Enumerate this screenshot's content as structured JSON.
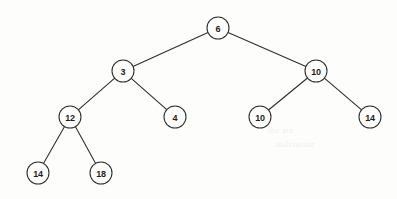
{
  "figure": {
    "width": 397,
    "height": 199,
    "background_color": "#fdfdfb",
    "stroke_color": "#2b2b2b",
    "label_color": "#1d1d1d",
    "node_radius": 11
  },
  "tree": {
    "nodes": [
      {
        "id": "n0",
        "label": "6",
        "x": 218,
        "y": 28,
        "level": 0
      },
      {
        "id": "n1",
        "label": "3",
        "x": 123,
        "y": 71,
        "level": 1
      },
      {
        "id": "n2",
        "label": "10",
        "x": 316,
        "y": 71,
        "level": 1
      },
      {
        "id": "n3",
        "label": "12",
        "x": 70,
        "y": 117,
        "level": 2
      },
      {
        "id": "n4",
        "label": "4",
        "x": 175,
        "y": 117,
        "level": 2
      },
      {
        "id": "n5",
        "label": "10",
        "x": 260,
        "y": 117,
        "level": 2
      },
      {
        "id": "n6",
        "label": "14",
        "x": 370,
        "y": 117,
        "level": 2
      },
      {
        "id": "n7",
        "label": "14",
        "x": 38,
        "y": 173,
        "level": 3
      },
      {
        "id": "n8",
        "label": "18",
        "x": 101,
        "y": 173,
        "level": 3
      }
    ],
    "edges": [
      {
        "from": "n0",
        "to": "n1"
      },
      {
        "from": "n0",
        "to": "n2"
      },
      {
        "from": "n1",
        "to": "n3"
      },
      {
        "from": "n1",
        "to": "n4"
      },
      {
        "from": "n2",
        "to": "n5"
      },
      {
        "from": "n2",
        "to": "n6"
      },
      {
        "from": "n3",
        "to": "n7"
      },
      {
        "from": "n3",
        "to": "n8"
      }
    ]
  },
  "artifacts": [
    {
      "text": "the are",
      "x": 268,
      "y": 126
    },
    {
      "text": "utilization",
      "x": 276,
      "y": 140
    }
  ]
}
